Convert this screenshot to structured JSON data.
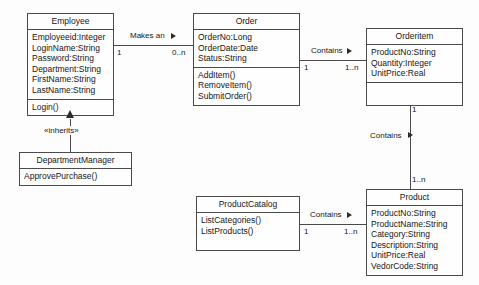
{
  "diagram": {
    "type": "uml-class-diagram",
    "colors": {
      "background": "#fdfdfd",
      "box_fill": "#fefefe",
      "line": "#4a4a4a",
      "text": "#161616"
    }
  },
  "classes": {
    "employee": {
      "name": "Employee",
      "attributes": [
        "Employeeid:Integer",
        "LoginName:String",
        "Password:String",
        "Department:String",
        "FirstName:String",
        "LastName:String"
      ],
      "operations": [
        "Login()"
      ]
    },
    "department_manager": {
      "name": "DepartmentManager",
      "attributes": [],
      "operations": [
        "ApprovePurchase()"
      ]
    },
    "order": {
      "name": "Order",
      "attributes": [
        "OrderNo:Long",
        "OrderDate:Date",
        "Status:String"
      ],
      "operations": [
        "AddItem()",
        "RemoveItem()",
        "SubmitOrder()"
      ]
    },
    "orderitem": {
      "name": "Orderitem",
      "attributes": [
        "ProductNo:String",
        "Quantity:Integer",
        "UnitPrice:Real"
      ],
      "operations": []
    },
    "product_catalog": {
      "name": "ProductCatalog",
      "attributes": [],
      "operations": [
        "ListCategories()",
        "ListProducts()"
      ]
    },
    "product": {
      "name": "Product",
      "attributes": [
        "ProductNo:String",
        "ProductName:String",
        "Category:String",
        "Description:String",
        "UnitPrice:Real",
        "VedorCode:String"
      ],
      "operations": []
    }
  },
  "relationships": {
    "employee_order": {
      "label": "Makes an",
      "source_multiplicity": "1",
      "target_multiplicity": "0..n"
    },
    "order_orderitem": {
      "label": "Contains",
      "source_multiplicity": "1",
      "target_multiplicity": "1..n"
    },
    "orderitem_product": {
      "label": "Contains",
      "source_multiplicity": "1",
      "target_multiplicity": "1..n"
    },
    "catalog_product": {
      "label": "Contains",
      "source_multiplicity": "1",
      "target_multiplicity": "1..n"
    },
    "inheritance": {
      "label": "«inherits»"
    }
  }
}
